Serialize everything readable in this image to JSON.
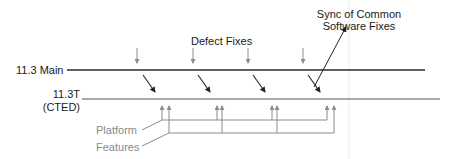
{
  "diagram": {
    "labels": {
      "main_branch": "11.3 Main",
      "ctd_branch_line1": "11.3T",
      "ctd_branch_line2": "(CTED)",
      "defect_fixes": "Defect Fixes",
      "sync_line1": "Sync of Common",
      "sync_line2": "Software Fixes",
      "platform": "Platform",
      "features": "Features"
    },
    "colors": {
      "line_dark": "#2a2a2a",
      "arrow_gray": "#8c8c8c",
      "text_dark": "#1a1a1a",
      "text_gray": "#8a8a8a",
      "guide_line": "#e8e8e8"
    },
    "defect_fix_drops_x": [
      137,
      193,
      248,
      303
    ],
    "merge_arrows": [
      {
        "from": [
          143,
          75
        ],
        "to": [
          155,
          92
        ]
      },
      {
        "from": [
          198,
          75
        ],
        "to": [
          210,
          92
        ]
      },
      {
        "from": [
          253,
          75
        ],
        "to": [
          265,
          92
        ]
      },
      {
        "from": [
          308,
          75
        ],
        "to": [
          320,
          92
        ]
      }
    ],
    "platform_arrows_x": [
      162,
      217,
      272,
      327
    ],
    "feature_arrows_x": [
      169,
      222,
      277,
      334
    ]
  }
}
